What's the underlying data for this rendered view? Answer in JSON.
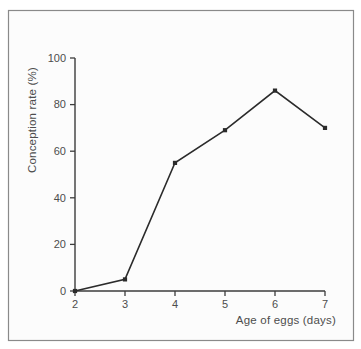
{
  "figure": {
    "outer_background": "#ffffff",
    "panel_background": "#fcfcfc",
    "frame_color": "#8a8a8a"
  },
  "chart_data": {
    "type": "line",
    "title": "",
    "xlabel": "Age of eggs (days)",
    "ylabel": "Conception rate (%)",
    "x": [
      2,
      3,
      4,
      5,
      6,
      7
    ],
    "values": [
      0,
      5,
      55,
      69,
      86,
      70
    ],
    "series": [
      {
        "name": "Conception rate",
        "values": [
          0,
          5,
          55,
          69,
          86,
          70
        ]
      }
    ],
    "xlim": [
      2,
      7
    ],
    "ylim": [
      0,
      100
    ],
    "xticks": [
      2,
      3,
      4,
      5,
      6,
      7
    ],
    "yticks": [
      0,
      20,
      40,
      60,
      80,
      100
    ],
    "grid": false,
    "legend": "none",
    "marker": "filled-square",
    "line_color": "#2b2b2b",
    "axis_color": "#3d3d3d",
    "label_color": "#4d4d4d"
  }
}
